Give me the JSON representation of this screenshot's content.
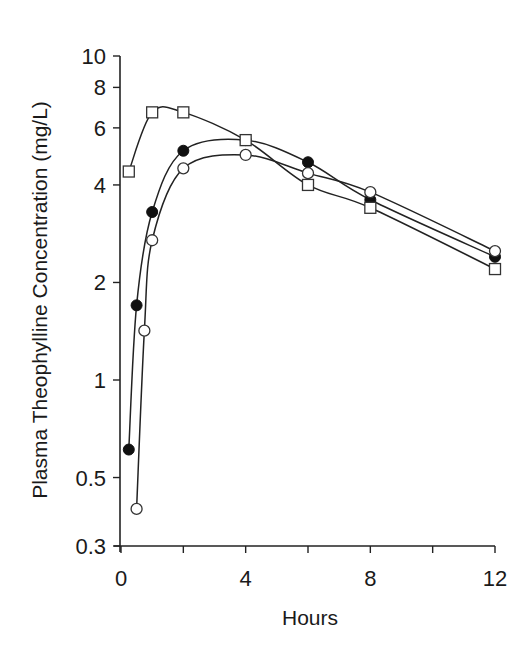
{
  "chart_data": {
    "type": "line",
    "title": "",
    "xlabel": "Hours",
    "ylabel": "Plasma Theophylline Concentration (mg/L)",
    "xlim": [
      0,
      12
    ],
    "ylim": [
      0.3,
      10
    ],
    "yscale": "log",
    "grid": false,
    "legend": "none",
    "x_ticks": [
      0,
      4,
      8,
      12
    ],
    "x_tick_labels": [
      "0",
      "4",
      "8",
      "12"
    ],
    "x_minor_ticks": [
      2,
      6,
      10
    ],
    "y_ticks": [
      0.3,
      0.5,
      1,
      2,
      4,
      6,
      8,
      10
    ],
    "y_tick_labels": [
      "0.3",
      "0.5",
      "1",
      "2",
      "4",
      "6",
      "8",
      "10"
    ],
    "series": [
      {
        "name": "filled circles",
        "marker": "filled-circle",
        "x": [
          0.25,
          0.5,
          1,
          2,
          4,
          6,
          8,
          12
        ],
        "y": [
          0.61,
          1.7,
          3.3,
          5.1,
          5.5,
          4.7,
          3.6,
          2.4
        ]
      },
      {
        "name": "open circles",
        "marker": "open-circle",
        "x": [
          0.5,
          0.75,
          1,
          2,
          4,
          6,
          8,
          12
        ],
        "y": [
          0.4,
          1.42,
          2.7,
          4.5,
          4.95,
          4.35,
          3.8,
          2.5
        ]
      },
      {
        "name": "open squares",
        "marker": "open-square",
        "x": [
          0.25,
          1,
          2,
          4,
          6,
          8,
          12
        ],
        "y": [
          4.4,
          6.7,
          6.7,
          5.5,
          4.0,
          3.4,
          2.2
        ]
      }
    ]
  }
}
